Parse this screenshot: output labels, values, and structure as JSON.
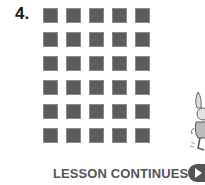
{
  "problem": {
    "number": "4."
  },
  "array": {
    "rows": 6,
    "columns": 5,
    "square_color": "#5c5c5c"
  },
  "footer": {
    "label": "LESSON CONTINUES",
    "icon": "play-arrow-icon"
  },
  "illustration": {
    "icon": "rabbit-character-icon"
  }
}
